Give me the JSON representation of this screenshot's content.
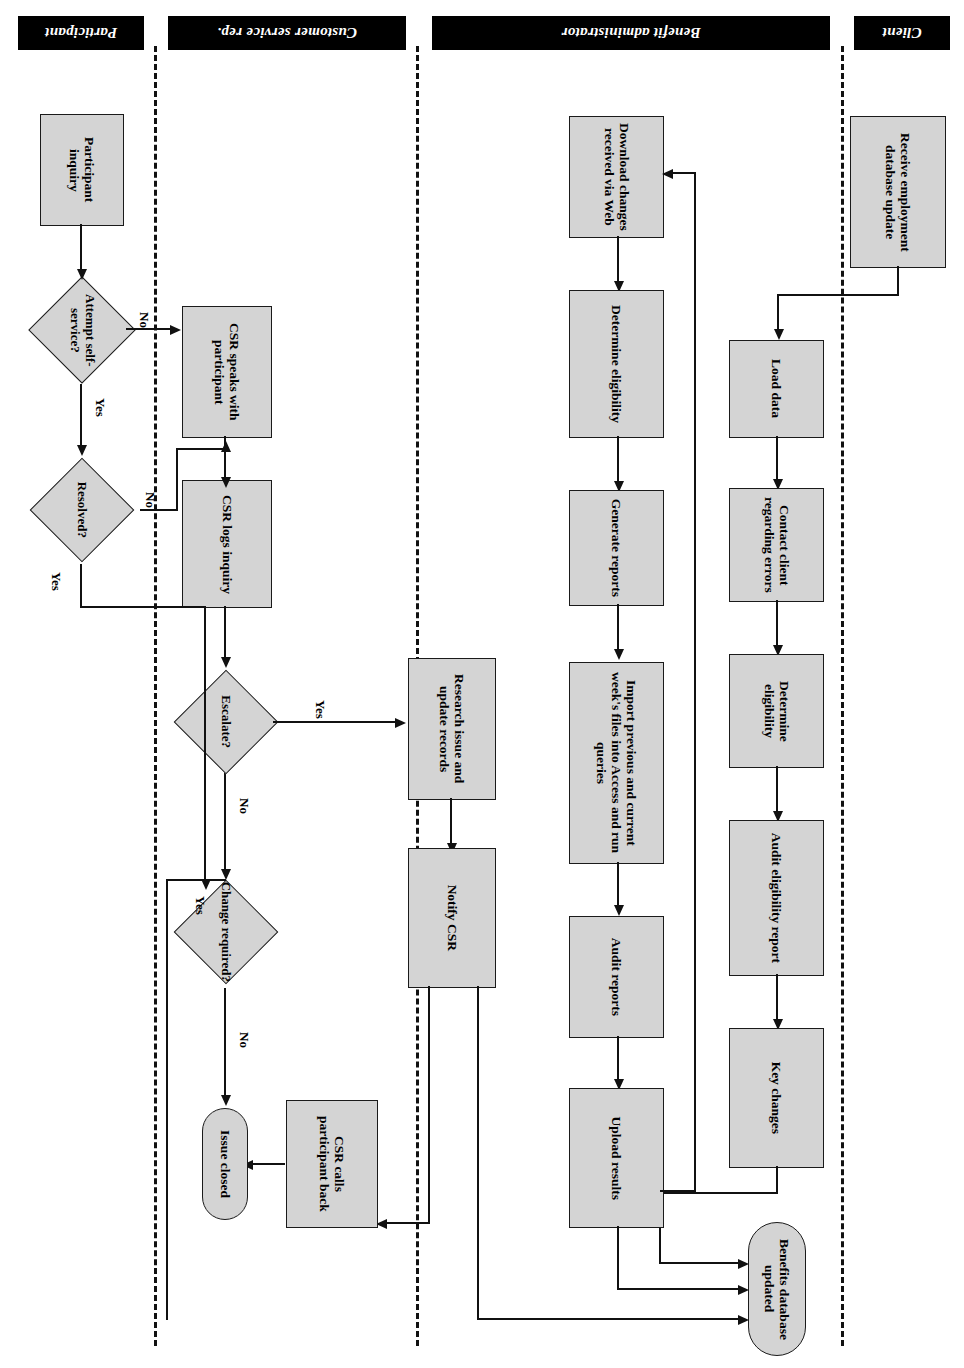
{
  "diagram": {
    "type": "cross-functional-flowchart",
    "orientation": "rotated-180",
    "fill_color": "#d4d4d4",
    "line_color": "#111111",
    "band_color": "#000000",
    "lanes": [
      {
        "id": "client",
        "label": "Client"
      },
      {
        "id": "benefit_admin",
        "label": "Benefit administrator"
      },
      {
        "id": "csr",
        "label": "Customer service rep."
      },
      {
        "id": "participant",
        "label": "Participant"
      }
    ],
    "nodes": {
      "receive_update": "Receive employment database update",
      "load_data": "Load data",
      "contact_client": "Contact client regarding errors",
      "determine_elig_1": "Determine eligibility",
      "audit_elig_report": "Audit eligibility report",
      "key_changes": "Key changes",
      "benefits_db_updated": "Benefits database updated",
      "download_changes": "Download changes received via Web",
      "determine_elig_2": "Determine eligibility",
      "generate_reports": "Generate reports",
      "import_files": "Import previous and current week's files into Access and run queries",
      "audit_reports": "Audit reports",
      "upload_results": "Upload results",
      "research_issue": "Research issue and update records",
      "notify_csr": "Notify CSR",
      "csr_calls_back": "CSR calls participant back",
      "issue_closed": "Issue closed",
      "escalate": "Escalate?",
      "change_required": "Change required?",
      "csr_logs_inquiry": "CSR logs inquiry",
      "csr_speaks": "CSR speaks with participant",
      "resolved": "Resolved?",
      "attempt_self_service": "Attempt self-service?",
      "participant_inquiry": "Participant inquiry"
    },
    "edge_labels": {
      "escalate_yes": "Yes",
      "escalate_no": "No",
      "change_required_yes": "Yes",
      "change_required_no": "No",
      "resolved_yes": "Yes",
      "resolved_no": "No",
      "self_service_yes": "Yes",
      "self_service_no": "No"
    }
  }
}
